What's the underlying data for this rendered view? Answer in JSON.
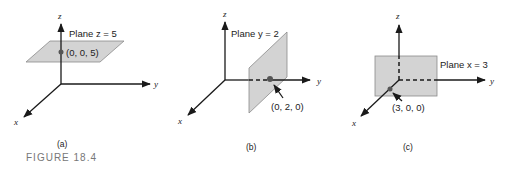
{
  "figure": {
    "title": "FIGURE 18.4",
    "panels": [
      {
        "id": "a",
        "caption": "(a)",
        "plane_label": "Plane z = 5",
        "point_label": "(0, 0, 5)",
        "axes": {
          "x": "x",
          "y": "y",
          "z": "z"
        }
      },
      {
        "id": "b",
        "caption": "(b)",
        "plane_label": "Plane y = 2",
        "point_label": "(0, 2, 0)",
        "axes": {
          "x": "x",
          "y": "y",
          "z": "z"
        }
      },
      {
        "id": "c",
        "caption": "(c)",
        "plane_label": "Plane x = 3",
        "point_label": "(3, 0, 0)",
        "axes": {
          "x": "x",
          "y": "y",
          "z": "z"
        }
      }
    ]
  },
  "colors": {
    "plane_fill": "#d3d3d3",
    "axis": "#1a1a1a",
    "figure_title": "#777777"
  }
}
